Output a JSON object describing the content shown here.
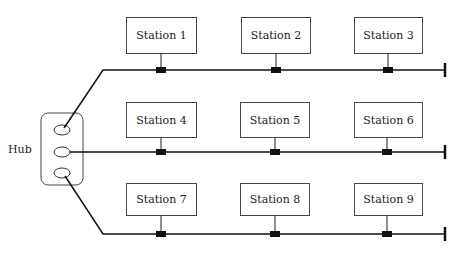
{
  "hub": {
    "label": "Hub"
  },
  "stations": [
    {
      "label": "Station 1"
    },
    {
      "label": "Station 2"
    },
    {
      "label": "Station 3"
    },
    {
      "label": "Station 4"
    },
    {
      "label": "Station 5"
    },
    {
      "label": "Station 6"
    },
    {
      "label": "Station 7"
    },
    {
      "label": "Station 8"
    },
    {
      "label": "Station 9"
    }
  ]
}
